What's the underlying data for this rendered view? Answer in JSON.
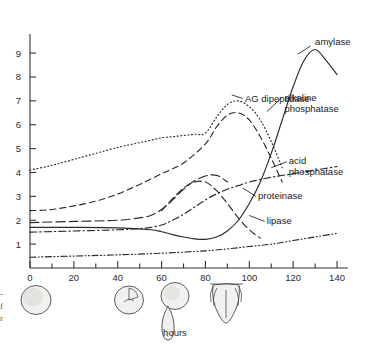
{
  "figure": {
    "name": "enzyme-activity-development-chart",
    "background": "#ffffff",
    "ink": "#2a2a2a"
  },
  "margin_caption": {
    "lines": [
      "-",
      "f",
      "r"
    ]
  },
  "chart_data": {
    "type": "line",
    "title": "",
    "xlabel": "hours",
    "ylabel": "",
    "xlim": [
      0,
      145
    ],
    "ylim": [
      0,
      9.8
    ],
    "xticks": [
      0,
      20,
      40,
      60,
      80,
      100,
      120,
      140
    ],
    "xticklabels": [
      "0",
      "20",
      "40",
      "60",
      "80",
      "100",
      "120",
      "140"
    ],
    "yticks": [
      1,
      2,
      3,
      4,
      5,
      6,
      7,
      8,
      9
    ],
    "yticklabels": [
      "1",
      "2",
      "3",
      "4",
      "5",
      "6",
      "7",
      "8",
      "9"
    ],
    "grid": false,
    "legend_position": "inline-labels",
    "minor_xticks": [
      10,
      30,
      50,
      70,
      90,
      110,
      130
    ],
    "series": [
      {
        "name": "AG dipeptidase",
        "label": "AG dipeptidase",
        "linestyle": "dotted",
        "dasharray": "1,2.6",
        "x": [
          0,
          10,
          20,
          30,
          40,
          50,
          55,
          60,
          65,
          70,
          75,
          80,
          85,
          90,
          95,
          100,
          105,
          110,
          115
        ],
        "values": [
          4.1,
          4.3,
          4.55,
          4.8,
          5.05,
          5.25,
          5.35,
          5.45,
          5.5,
          5.55,
          5.6,
          5.65,
          6.3,
          6.85,
          7.0,
          6.75,
          6.2,
          5.3,
          4.2
        ]
      },
      {
        "name": "alkaline phosphatase",
        "label": "alkaline phosphatase",
        "linestyle": "dashed",
        "dasharray": "6,4",
        "x": [
          0,
          10,
          20,
          30,
          40,
          50,
          60,
          70,
          80,
          85,
          90,
          95,
          100,
          105,
          110,
          115
        ],
        "values": [
          2.4,
          2.45,
          2.6,
          2.8,
          3.1,
          3.5,
          3.95,
          4.4,
          5.2,
          5.9,
          6.4,
          6.5,
          6.2,
          5.5,
          4.6,
          3.6
        ]
      },
      {
        "name": "acid phosphatase",
        "label": "acid phosphatase",
        "linestyle": "dash-dot",
        "dasharray": "7,3,1.4,3",
        "x": [
          0,
          20,
          40,
          50,
          55,
          60,
          65,
          70,
          75,
          80,
          85,
          90,
          95,
          100,
          110,
          120,
          130,
          140
        ],
        "values": [
          1.5,
          1.55,
          1.6,
          1.65,
          1.7,
          1.8,
          2.0,
          2.25,
          2.55,
          2.85,
          3.1,
          3.3,
          3.45,
          3.6,
          3.8,
          3.95,
          4.1,
          4.25
        ]
      },
      {
        "name": "proteinase",
        "label": "proteinase",
        "linestyle": "long-dash",
        "dasharray": "9,4",
        "x": [
          0,
          20,
          40,
          50,
          55,
          60,
          65,
          70,
          75,
          80,
          83,
          86,
          90
        ],
        "values": [
          1.9,
          1.95,
          2.0,
          2.1,
          2.2,
          2.45,
          2.85,
          3.3,
          3.65,
          3.85,
          3.9,
          3.85,
          3.6
        ]
      },
      {
        "name": "lipase",
        "label": "lipase",
        "linestyle": "dashed-medium",
        "dasharray": "7,4",
        "x": [
          60,
          65,
          70,
          75,
          80,
          85,
          90,
          95,
          100,
          105
        ],
        "values": [
          2.4,
          2.9,
          3.35,
          3.6,
          3.6,
          3.25,
          2.7,
          2.1,
          1.6,
          1.25
        ]
      },
      {
        "name": "amylase",
        "label": "amylase",
        "linestyle": "solid",
        "dasharray": "none",
        "x": [
          0,
          20,
          40,
          55,
          60,
          65,
          70,
          75,
          80,
          85,
          90,
          95,
          100,
          105,
          110,
          115,
          120,
          125,
          130,
          135,
          140
        ],
        "values": [
          1.7,
          1.7,
          1.68,
          1.6,
          1.52,
          1.4,
          1.3,
          1.22,
          1.2,
          1.3,
          1.55,
          2.0,
          2.7,
          3.6,
          4.8,
          6.2,
          7.6,
          8.7,
          9.15,
          8.7,
          8.1
        ]
      },
      {
        "name": "baseline-enzyme",
        "label": "",
        "linestyle": "dash-dot-dot",
        "dasharray": "6,2.5,1,2.5,1,2.5",
        "x": [
          0,
          20,
          40,
          60,
          80,
          90,
          100,
          110,
          120,
          130,
          140
        ],
        "values": [
          0.45,
          0.5,
          0.55,
          0.62,
          0.72,
          0.8,
          0.9,
          1.0,
          1.15,
          1.3,
          1.45
        ]
      }
    ],
    "annotations": [
      {
        "name": "amylase",
        "text": "amylase",
        "x": 130,
        "y": 9.35
      },
      {
        "name": "alkaline-phosphatase",
        "text_lines": [
          "alkaline",
          "phosphatase"
        ],
        "x": 116,
        "y": 7.0
      },
      {
        "name": "ag-dipeptidase",
        "text": "AG dipeptidase",
        "x": 98,
        "y": 6.95
      },
      {
        "name": "acid-phosphatase",
        "text_lines": [
          "acid",
          "phosphatase"
        ],
        "x": 118,
        "y": 4.35
      },
      {
        "name": "proteinase",
        "text": "proteinase",
        "x": 104,
        "y": 2.9
      },
      {
        "name": "lipase",
        "text": "lipase",
        "x": 108,
        "y": 1.85
      }
    ],
    "stages": [
      {
        "name": "egg-stage",
        "label": "",
        "x": 3
      },
      {
        "name": "gastrula-stage",
        "label": "",
        "x": 48
      },
      {
        "name": "tadpole-stage",
        "label": "",
        "x": 70
      },
      {
        "name": "hatched-larva-stage",
        "label": "",
        "x": 92
      }
    ]
  }
}
